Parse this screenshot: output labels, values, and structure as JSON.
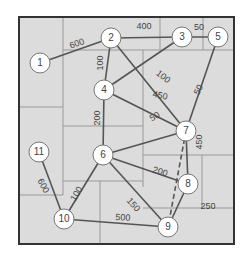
{
  "diagram": {
    "type": "weighted-graph",
    "colors": {
      "background": "#dcdcdc",
      "frame": "#333333",
      "grid": "#999999",
      "edge": "#555555",
      "node_fill": "#ffffff",
      "node_stroke": "#777777",
      "text": "#444444"
    },
    "nodes": [
      {
        "id": "1",
        "label": "1",
        "x": 40,
        "y": 63
      },
      {
        "id": "2",
        "label": "2",
        "x": 111,
        "y": 38
      },
      {
        "id": "3",
        "label": "3",
        "x": 182,
        "y": 37
      },
      {
        "id": "4",
        "label": "4",
        "x": 104,
        "y": 90
      },
      {
        "id": "5",
        "label": "5",
        "x": 218,
        "y": 37
      },
      {
        "id": "6",
        "label": "6",
        "x": 103,
        "y": 155
      },
      {
        "id": "7",
        "label": "7",
        "x": 186,
        "y": 131
      },
      {
        "id": "8",
        "label": "8",
        "x": 188,
        "y": 184
      },
      {
        "id": "9",
        "label": "9",
        "x": 168,
        "y": 227
      },
      {
        "id": "10",
        "label": "10",
        "x": 64,
        "y": 219
      },
      {
        "id": "11",
        "label": "11",
        "x": 39,
        "y": 152
      }
    ],
    "edges": [
      {
        "from": "1",
        "to": "2",
        "weight": "600",
        "dashed": false,
        "lx": 77,
        "ly": 44,
        "rot": -20
      },
      {
        "from": "2",
        "to": "3",
        "weight": "400",
        "dashed": false,
        "lx": 144,
        "ly": 27,
        "rot": 0
      },
      {
        "from": "3",
        "to": "5",
        "weight": "50",
        "dashed": false,
        "lx": 199,
        "ly": 28,
        "rot": 0
      },
      {
        "from": "2",
        "to": "4",
        "weight": "100",
        "dashed": false,
        "lx": 101,
        "ly": 63,
        "rot": -90
      },
      {
        "from": "2",
        "to": "7",
        "weight": "100",
        "dashed": false,
        "lx": 163,
        "ly": 77,
        "rot": 38
      },
      {
        "from": "3",
        "to": "4",
        "weight": "",
        "dashed": false,
        "lx": 0,
        "ly": 0,
        "rot": 0
      },
      {
        "from": "5",
        "to": "7",
        "weight": "50",
        "dashed": false,
        "lx": 199,
        "ly": 90,
        "rot": -62
      },
      {
        "from": "4",
        "to": "7",
        "weight": "450",
        "dashed": false,
        "lx": 160,
        "ly": 96,
        "rot": 12
      },
      {
        "from": "4",
        "to": "6",
        "weight": "200",
        "dashed": false,
        "lx": 98,
        "ly": 118,
        "rot": -90
      },
      {
        "from": "6",
        "to": "7",
        "weight": "50",
        "dashed": false,
        "lx": 155,
        "ly": 117,
        "rot": -30
      },
      {
        "from": "7",
        "to": "8",
        "weight": "450",
        "dashed": false,
        "lx": 200,
        "ly": 142,
        "rot": -90
      },
      {
        "from": "7",
        "to": "9",
        "weight": "",
        "dashed": true,
        "lx": 0,
        "ly": 0,
        "rot": 0
      },
      {
        "from": "6",
        "to": "8",
        "weight": "200",
        "dashed": false,
        "lx": 160,
        "ly": 172,
        "rot": 18
      },
      {
        "from": "6",
        "to": "9",
        "weight": "150",
        "dashed": false,
        "lx": 133,
        "ly": 205,
        "rot": 48
      },
      {
        "from": "8",
        "to": "9",
        "weight": "250",
        "dashed": false,
        "lx": 208,
        "ly": 207,
        "rot": 0
      },
      {
        "from": "6",
        "to": "10",
        "weight": "100",
        "dashed": false,
        "lx": 77,
        "ly": 194,
        "rot": -60
      },
      {
        "from": "10",
        "to": "9",
        "weight": "500",
        "dashed": false,
        "lx": 123,
        "ly": 218,
        "rot": 3
      },
      {
        "from": "11",
        "to": "10",
        "weight": "600",
        "dashed": false,
        "lx": 43,
        "ly": 186,
        "rot": 62
      }
    ],
    "frame": {
      "x": 19,
      "y": 17,
      "w": 215,
      "h": 227
    },
    "grid_lines": [
      [
        63,
        17,
        63,
        107
      ],
      [
        63,
        50,
        234,
        50
      ],
      [
        160,
        17,
        160,
        50
      ],
      [
        203,
        17,
        203,
        50
      ],
      [
        19,
        107,
        63,
        107
      ],
      [
        143,
        50,
        143,
        187
      ],
      [
        63,
        126,
        143,
        126
      ],
      [
        63,
        107,
        63,
        195
      ],
      [
        63,
        181,
        143,
        181
      ],
      [
        143,
        155,
        234,
        155
      ],
      [
        202,
        155,
        202,
        208
      ],
      [
        143,
        208,
        234,
        208
      ],
      [
        19,
        195,
        63,
        195
      ],
      [
        100,
        181,
        100,
        244
      ]
    ]
  }
}
